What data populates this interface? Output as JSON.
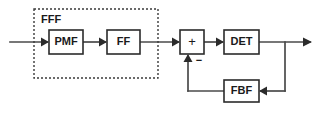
{
  "diagram": {
    "canvas": {
      "width": 320,
      "height": 116,
      "background": "#ffffff"
    },
    "colors": {
      "box_stroke": "#2b2b2b",
      "box_fill": "#ffffff",
      "wire": "#4a4a4a",
      "dashed_group": "#3a3a3a",
      "text": "#1a1a1a"
    },
    "groups": [
      {
        "id": "fff-group",
        "label": "FFF",
        "style": "dashed",
        "x": 34,
        "y": 9,
        "width": 124,
        "height": 69,
        "label_x": 41,
        "label_y": 20
      }
    ],
    "blocks": [
      {
        "id": "pmf",
        "label": "PMF",
        "x": 49,
        "y": 30,
        "width": 34,
        "height": 24,
        "cx": 66,
        "cy": 42
      },
      {
        "id": "ff",
        "label": "FF",
        "x": 107,
        "y": 30,
        "width": 33,
        "height": 24,
        "cx": 123.5,
        "cy": 42
      },
      {
        "id": "sum",
        "label": "+",
        "x": 180,
        "y": 30,
        "width": 24,
        "height": 24,
        "cx": 192,
        "cy": 42
      },
      {
        "id": "det",
        "label": "DET",
        "x": 224,
        "y": 30,
        "width": 35,
        "height": 24,
        "cx": 241.5,
        "cy": 42
      },
      {
        "id": "fbf",
        "label": "FBF",
        "x": 224,
        "y": 80,
        "width": 35,
        "height": 22,
        "cx": 241.5,
        "cy": 91
      }
    ],
    "annotations": [
      {
        "id": "minus-sign",
        "label": "−",
        "x": 199,
        "y": 61
      }
    ],
    "signal_flow": [
      {
        "id": "input-wire",
        "from": "input-source",
        "to": "pmf"
      },
      {
        "id": "pmf-to-ff-wire",
        "from": "pmf",
        "to": "ff"
      },
      {
        "id": "ff-to-sum-wire",
        "from": "ff",
        "to": "sum"
      },
      {
        "id": "sum-to-det-wire",
        "from": "sum",
        "to": "det"
      },
      {
        "id": "det-to-output-wire",
        "from": "det",
        "to": "output-sink"
      },
      {
        "id": "output-tap-to-fbf-wire",
        "from": "output-tap",
        "to": "fbf"
      },
      {
        "id": "fbf-to-sum-wire",
        "from": "fbf",
        "to": "sum"
      }
    ]
  }
}
